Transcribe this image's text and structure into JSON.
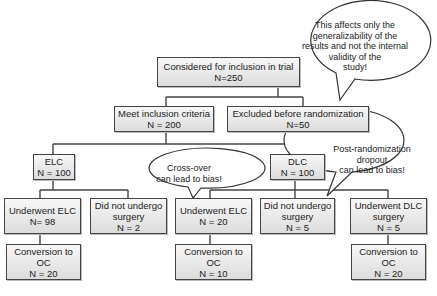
{
  "boxes": {
    "considered": {
      "label": "Considered for inclusion in trial",
      "n": "N=250"
    },
    "meet": {
      "label": "Meet inclusion criteria",
      "n": "N = 200"
    },
    "excluded": {
      "label": "Excluded before randomization",
      "n": "N=50"
    },
    "elc": {
      "label": "ELC",
      "n": "N = 100"
    },
    "dlc": {
      "label": "DLC",
      "n": "N = 100"
    },
    "elc_underwent": {
      "label": "Underwent ELC",
      "n": "N= 98"
    },
    "elc_no_surgery": {
      "label1": "Did not undergo",
      "label2": "surgery",
      "n": "N = 2"
    },
    "dlc_underwent_elc": {
      "label": "Underwent ELC",
      "n": "N = 20"
    },
    "dlc_no_surgery": {
      "label1": "Did not undergo",
      "label2": "surgery",
      "n": "N = 5"
    },
    "dlc_underwent_dlc": {
      "label1": "Underwent DLC",
      "label2": "surgery",
      "n": "N = 5"
    },
    "conv_elc": {
      "label1": "Conversion to",
      "label2": "OC",
      "n": "N = 20"
    },
    "conv_crossover": {
      "label1": "Conversion to",
      "label2": "OC",
      "n": "N = 10"
    },
    "conv_dlc": {
      "label1": "Conversion to",
      "label2": "OC",
      "n": "N = 20"
    }
  },
  "callouts": {
    "generalizability": [
      "This affects only the",
      "generalizability of the",
      "results and not the internal",
      "validity of the",
      "study!"
    ],
    "crossover": [
      "Cross-over",
      "can lead to bias!"
    ],
    "dropout": [
      "Post-randomization",
      "dropout",
      "can lead to bias!"
    ]
  }
}
